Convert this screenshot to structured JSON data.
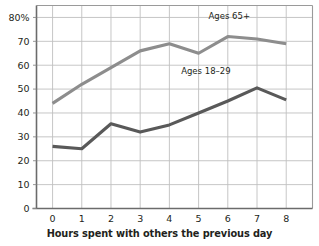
{
  "chart_data": {
    "type": "line",
    "title": "",
    "xlabel": "Hours spent with others the previous day",
    "ylabel": "",
    "x": [
      0,
      1,
      2,
      3,
      4,
      5,
      6,
      7,
      8
    ],
    "xtick_labels": [
      "0",
      "1",
      "2",
      "3",
      "4",
      "5",
      "6",
      "7",
      "8"
    ],
    "ytick_labels": [
      "0",
      "10",
      "20",
      "30",
      "40",
      "50",
      "60",
      "70",
      "80%"
    ],
    "ytick_values": [
      0,
      10,
      20,
      30,
      40,
      50,
      60,
      70,
      80
    ],
    "ylim": [
      0,
      85
    ],
    "xlim": [
      -0.55,
      8.9
    ],
    "grid": true,
    "legend_position": "inline-annotations",
    "series": [
      {
        "name": "Ages 65+",
        "color": "#8d8d8d",
        "label_text": "Ages 65+",
        "values": [
          44,
          52,
          59,
          66,
          69,
          65,
          72,
          71,
          69
        ]
      },
      {
        "name": "Ages 18–29",
        "color": "#595959",
        "label_text": "Ages 18–29",
        "values": [
          26,
          25,
          35.5,
          32,
          35,
          40,
          45,
          50.5,
          45.5
        ]
      }
    ],
    "annotations": [
      {
        "text": "Ages 65+",
        "x": 6.05,
        "y": 79.5
      },
      {
        "text": "Ages 18–29",
        "x": 5.25,
        "y": 56.5
      }
    ]
  }
}
